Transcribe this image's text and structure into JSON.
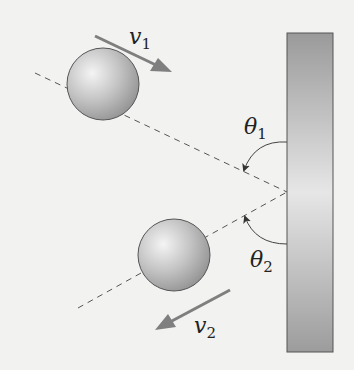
{
  "labels": {
    "v1": "v",
    "v1_sub": "1",
    "v2": "v",
    "v2_sub": "2",
    "theta1": "θ",
    "theta1_sub": "1",
    "theta2": "θ",
    "theta2_sub": "2"
  },
  "colors": {
    "background": "#f2f2f0",
    "wall": "#a9a9a9",
    "arrow": "#7f7f7f",
    "ball": "#a8a8a8",
    "line": "#555555"
  }
}
